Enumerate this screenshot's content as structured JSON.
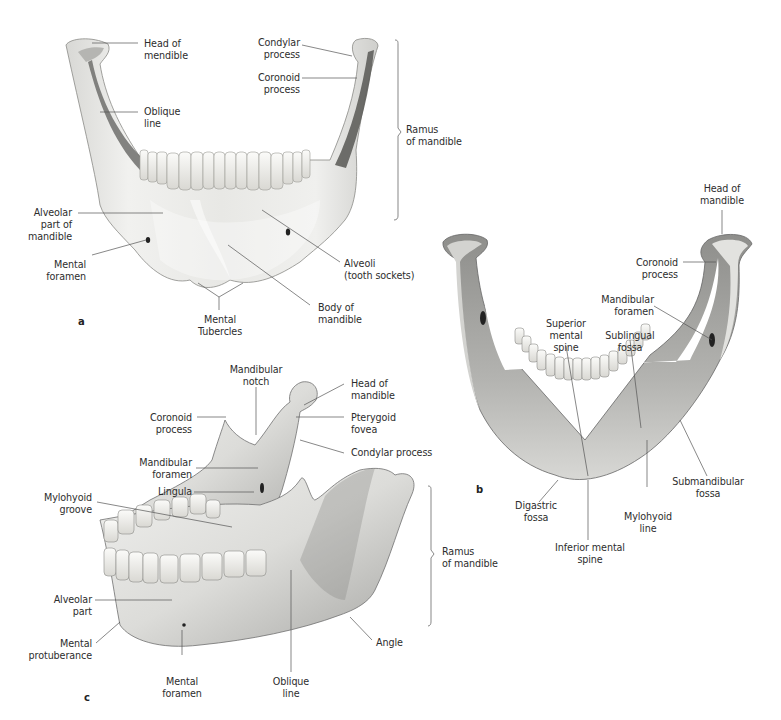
{
  "figure": {
    "subject": "Mandible",
    "panels": [
      {
        "id": "a",
        "view": "Anterior view",
        "labels": [
          {
            "key": "head",
            "text": "Head of\nmendible"
          },
          {
            "key": "oblique",
            "text": "Oblique\nline"
          },
          {
            "key": "condylar",
            "text": "Condylar\nprocess"
          },
          {
            "key": "coronoid",
            "text": "Coronoid\nprocess"
          },
          {
            "key": "ramus",
            "text": "Ramus\nof mandible"
          },
          {
            "key": "alveolar",
            "text": "Alveolar\npart of\nmandible"
          },
          {
            "key": "mental_foramen",
            "text": "Mental\nforamen"
          },
          {
            "key": "alveoli",
            "text": "Alveoli\n(tooth sockets)"
          },
          {
            "key": "body",
            "text": "Body of\nmandible"
          },
          {
            "key": "tubercles",
            "text": "Mental\nTubercles"
          }
        ]
      },
      {
        "id": "b",
        "view": "Posterior view",
        "labels": [
          {
            "key": "head",
            "text": "Head of\nmandible"
          },
          {
            "key": "coronoid",
            "text": "Coronoid\nprocess"
          },
          {
            "key": "mand_foramen",
            "text": "Mandibular\nforamen"
          },
          {
            "key": "sup_spine",
            "text": "Superior\nmental\nspine"
          },
          {
            "key": "sublingual",
            "text": "Sublingual\nfossa"
          },
          {
            "key": "submandibular",
            "text": "Submandibular\nfossa"
          },
          {
            "key": "digastric",
            "text": "Digastric\nfossa"
          },
          {
            "key": "mylohyoid_line",
            "text": "Mylohyoid\nline"
          },
          {
            "key": "inf_spine",
            "text": "Inferior mental\nspine"
          }
        ]
      },
      {
        "id": "c",
        "view": "Oblique left lateral / medial views",
        "labels": [
          {
            "key": "notch",
            "text": "Mandibular\nnotch"
          },
          {
            "key": "head",
            "text": "Head of\nmandible"
          },
          {
            "key": "coronoid",
            "text": "Coronoid\nprocess"
          },
          {
            "key": "pterygoid",
            "text": "Pterygoid\nfovea"
          },
          {
            "key": "condylar",
            "text": "Condylar process"
          },
          {
            "key": "mand_foramen",
            "text": "Mandibular\nforamen"
          },
          {
            "key": "lingula",
            "text": "Lingula"
          },
          {
            "key": "mylohyoid_groove",
            "text": "Mylohyoid\ngroove"
          },
          {
            "key": "ramus",
            "text": "Ramus\nof mandible"
          },
          {
            "key": "alveolar",
            "text": "Alveolar\npart"
          },
          {
            "key": "protuberance",
            "text": "Mental\nprotuberance"
          },
          {
            "key": "mental_foramen",
            "text": "Mental\nforamen"
          },
          {
            "key": "oblique",
            "text": "Oblique\nline"
          },
          {
            "key": "angle",
            "text": "Angle"
          }
        ]
      }
    ]
  },
  "colors": {
    "bone_light": "#eeeeec",
    "bone_mid": "#c9c9c6",
    "bone_dark": "#7d7d7a",
    "tooth": "#f4f3ef",
    "leader": "#555555",
    "text": "#2d2d2d"
  }
}
